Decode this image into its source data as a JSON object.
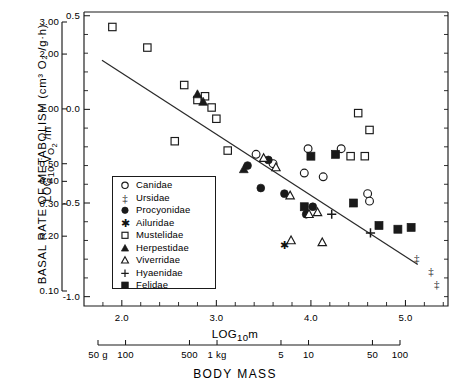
{
  "chart_data": {
    "type": "scatter",
    "title": "",
    "ylabel": "BASAL RATE OF METABOLISM (cm³ O₂ /g·h)",
    "ylabel_inner": "LOG₁₀ V̇ₒ₂ /m",
    "xlabel_inner": "LOG₁₀m",
    "xlabel_outer": "BODY MASS",
    "xlim": [
      1.6,
      5.45
    ],
    "ylim": [
      -1.05,
      0.52
    ],
    "grid": false,
    "legend_position": "inside-left",
    "y_axis_inner": {
      "label": "LOG₁₀ V̇ₒ₂ /m",
      "ticks": [
        "0.5",
        "0.0",
        "-0.5",
        "-1.0"
      ],
      "tick_values": [
        0.5,
        0.0,
        -0.5,
        -1.0
      ],
      "minor_step": 0.1
    },
    "y_axis_outer": {
      "label": "BASAL RATE OF METABOLISM (cm³ O₂ /g·h)",
      "ticks": [
        "3.00",
        "2.00",
        "1.00",
        "0.50",
        "0.40",
        "0.30",
        "0.20",
        "0.10"
      ],
      "tick_values": [
        3.0,
        2.0,
        1.0,
        0.5,
        0.4,
        0.3,
        0.2,
        0.1
      ],
      "scale": "log"
    },
    "x_axis_inner": {
      "label": "LOG₁₀m",
      "ticks": [
        "2.0",
        "3.0",
        "4.0",
        "5.0"
      ],
      "tick_values": [
        2.0,
        3.0,
        4.0,
        5.0
      ],
      "minor_step": 0.2
    },
    "x_axis_outer": {
      "label": "BODY MASS",
      "ticks": [
        "50 g",
        "100",
        "500",
        "1 kg",
        "5",
        "10",
        "50",
        "100"
      ],
      "tick_values": [
        1.699,
        2.0,
        2.699,
        3.0,
        3.699,
        4.0,
        4.699,
        5.0
      ]
    },
    "regression_line": {
      "x_start": 1.79,
      "y_start": 0.262,
      "x_end": 5.13,
      "y_end": -0.828,
      "slope": -0.326,
      "intercept": 0.846
    },
    "legend": [
      {
        "label": "Canidae",
        "marker": "open-circle"
      },
      {
        "label": "Ursidae",
        "marker": "double-dagger"
      },
      {
        "label": "Procyonidae",
        "marker": "filled-circle"
      },
      {
        "label": "Ailuridae",
        "marker": "asterisk"
      },
      {
        "label": "Mustelidae",
        "marker": "open-square"
      },
      {
        "label": "Herpestidae",
        "marker": "filled-triangle"
      },
      {
        "label": "Viverridae",
        "marker": "open-triangle"
      },
      {
        "label": "Hyaenidae",
        "marker": "plus"
      },
      {
        "label": "Felidae",
        "marker": "filled-square"
      }
    ],
    "series": [
      {
        "name": "Canidae",
        "marker": "open-circle",
        "points": [
          [
            3.42,
            -0.24
          ],
          [
            3.6,
            -0.29
          ],
          [
            3.93,
            -0.34
          ],
          [
            3.97,
            -0.21
          ],
          [
            4.13,
            -0.36
          ],
          [
            4.32,
            -0.21
          ],
          [
            4.6,
            -0.45
          ],
          [
            4.62,
            -0.49
          ]
        ]
      },
      {
        "name": "Ursidae",
        "marker": "double-dagger",
        "points": [
          [
            5.12,
            -0.79
          ],
          [
            5.27,
            -0.86
          ],
          [
            5.33,
            -0.93
          ]
        ]
      },
      {
        "name": "Procyonidae",
        "marker": "filled-circle",
        "points": [
          [
            3.33,
            -0.3
          ],
          [
            3.55,
            -0.27
          ],
          [
            3.72,
            -0.45
          ],
          [
            3.95,
            -0.56
          ],
          [
            3.47,
            -0.42
          ],
          [
            4.02,
            -0.52
          ]
        ]
      },
      {
        "name": "Ailuridae",
        "marker": "asterisk",
        "points": [
          [
            3.72,
            -0.72
          ]
        ]
      },
      {
        "name": "Mustelidae",
        "marker": "open-square",
        "points": [
          [
            1.9,
            0.44
          ],
          [
            2.27,
            0.33
          ],
          [
            2.66,
            0.13
          ],
          [
            2.8,
            0.05
          ],
          [
            2.88,
            0.07
          ],
          [
            2.95,
            0.01
          ],
          [
            3.0,
            -0.05
          ],
          [
            2.56,
            -0.17
          ],
          [
            3.12,
            -0.22
          ],
          [
            4.42,
            -0.25
          ],
          [
            4.57,
            -0.25
          ],
          [
            4.5,
            -0.02
          ],
          [
            4.62,
            -0.11
          ]
        ]
      },
      {
        "name": "Herpestidae",
        "marker": "filled-triangle",
        "points": [
          [
            2.8,
            0.08
          ],
          [
            2.86,
            0.04
          ],
          [
            3.29,
            -0.32
          ]
        ]
      },
      {
        "name": "Viverridae",
        "marker": "open-triangle",
        "points": [
          [
            3.5,
            -0.26
          ],
          [
            3.63,
            -0.31
          ],
          [
            3.78,
            -0.46
          ],
          [
            3.98,
            -0.56
          ],
          [
            3.79,
            -0.7
          ],
          [
            4.12,
            -0.71
          ],
          [
            4.07,
            -0.55
          ]
        ]
      },
      {
        "name": "Hyaenidae",
        "marker": "plus",
        "points": [
          [
            4.22,
            -0.56
          ],
          [
            4.63,
            -0.66
          ]
        ]
      },
      {
        "name": "Felidae",
        "marker": "filled-square",
        "points": [
          [
            3.93,
            -0.52
          ],
          [
            4.0,
            -0.25
          ],
          [
            4.26,
            -0.24
          ],
          [
            4.45,
            -0.5
          ],
          [
            4.72,
            -0.62
          ],
          [
            4.92,
            -0.64
          ],
          [
            5.06,
            -0.63
          ]
        ]
      }
    ]
  }
}
